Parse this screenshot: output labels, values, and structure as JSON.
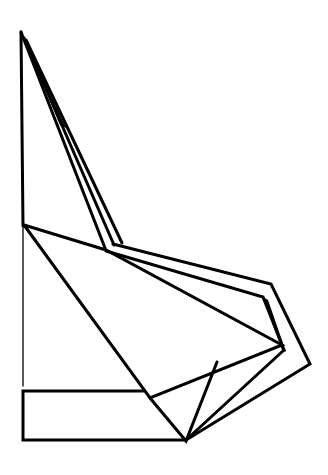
{
  "figure": {
    "stroke_color": "#000000",
    "background_color": "#ffffff",
    "shapes": {
      "apex": [
        21,
        32
      ],
      "left_edge_top": [
        [
          21,
          32
        ],
        [
          24,
          225
        ]
      ],
      "left_edge_thin": [
        [
          22,
          225
        ],
        [
          22,
          386
        ]
      ],
      "upper_fan_lines": [
        [
          [
            21,
            32
          ],
          [
            105,
            247
          ]
        ],
        [
          [
            21,
            32
          ],
          [
            113,
            245
          ]
        ],
        [
          [
            21,
            32
          ],
          [
            122,
            243
          ]
        ]
      ],
      "flap_outer": [
        [
          113,
          244
        ],
        [
          270,
          284
        ],
        [
          310,
          364
        ],
        [
          185,
          440
        ]
      ],
      "flap_inner": [
        [
          106,
          250
        ],
        [
          263,
          298
        ],
        [
          282,
          351
        ]
      ],
      "center_kite": [
        [
          24,
          225
        ],
        [
          106,
          250
        ],
        [
          282,
          345
        ],
        [
          150,
          398
        ],
        [
          24,
          225
        ]
      ],
      "lower_triangle": [
        [
          150,
          398
        ],
        [
          185,
          440
        ],
        [
          217,
          363
        ]
      ],
      "crease_to_tip": [
        [
          185,
          440
        ],
        [
          282,
          350
        ]
      ],
      "bottom_rectangle": {
        "x": 22,
        "y": 391,
        "width": 163,
        "height": 49
      }
    }
  }
}
